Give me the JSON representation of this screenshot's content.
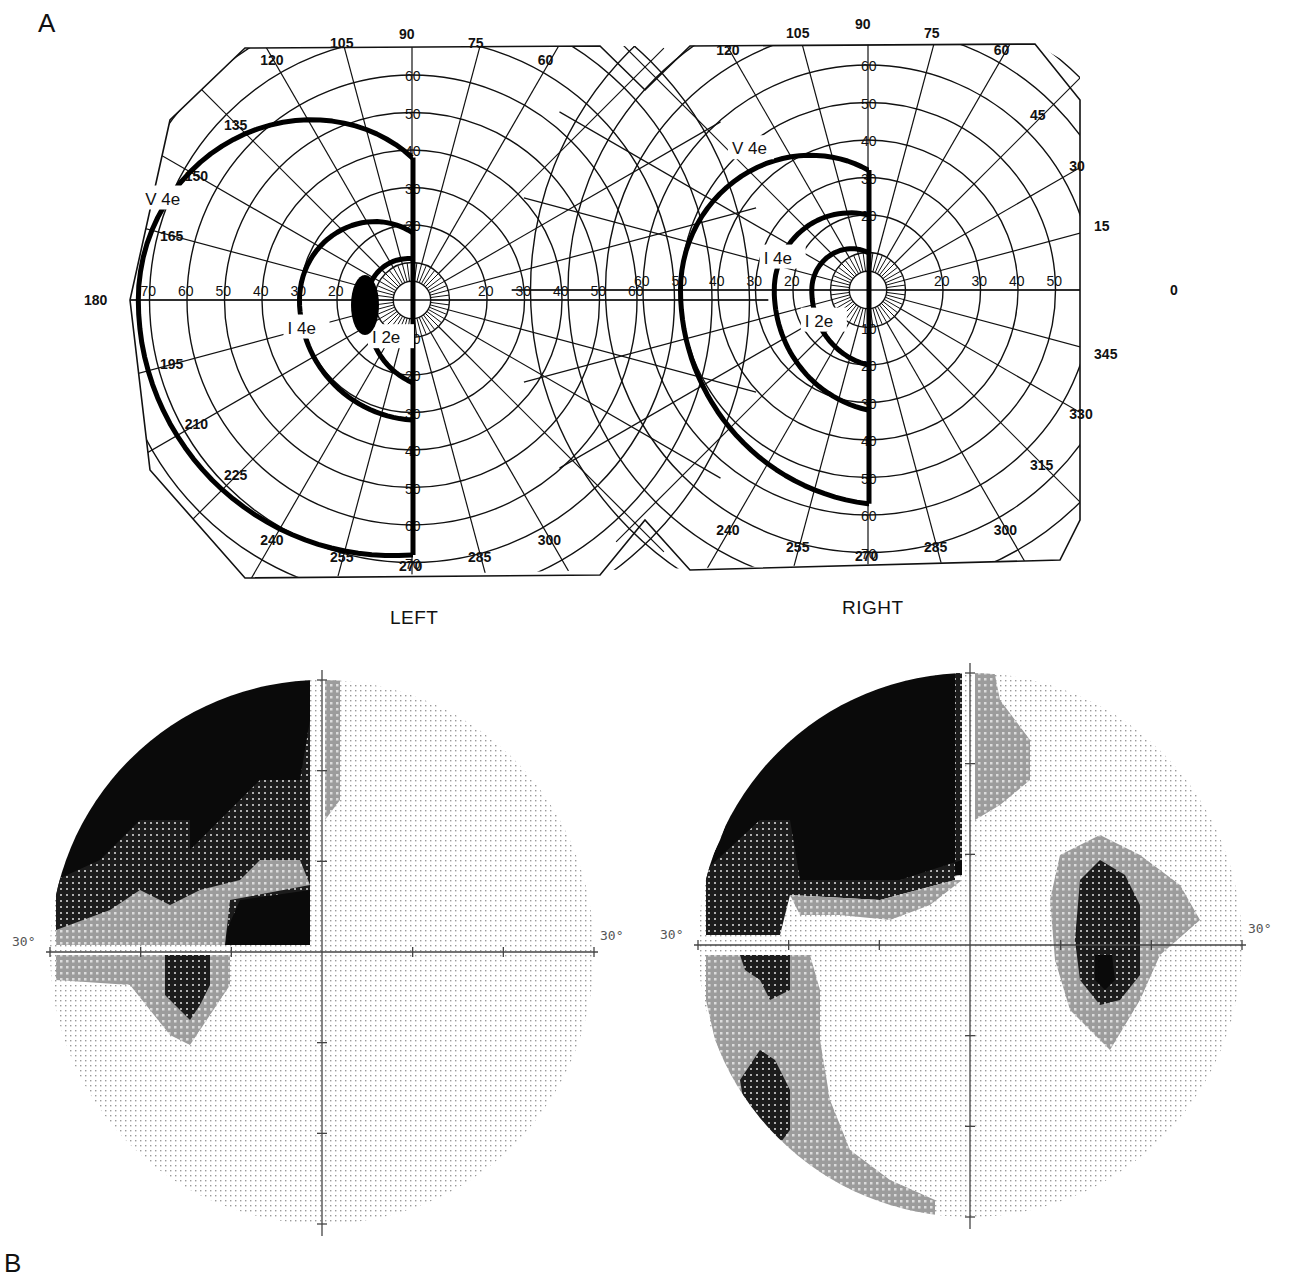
{
  "figure": {
    "panel_a_label": "A",
    "panel_b_label": "B"
  },
  "goldmann": {
    "left": {
      "eye_label": "LEFT",
      "center": [
        412,
        300
      ],
      "isopters": [
        {
          "name": "V 4e",
          "label": "V 4e"
        },
        {
          "name": "I 4e",
          "label": "I 4e"
        },
        {
          "name": "I 2e",
          "label": "I 2e"
        }
      ]
    },
    "right": {
      "eye_label": "RIGHT",
      "center": [
        868,
        290
      ],
      "isopters": [
        {
          "name": "V 4e",
          "label": "V 4e"
        },
        {
          "name": "I 4e",
          "label": "I 4e"
        },
        {
          "name": "I 2e",
          "label": "I 2e"
        }
      ]
    },
    "meridian_labels": [
      "0",
      "15",
      "30",
      "45",
      "60",
      "75",
      "90",
      "105",
      "120",
      "135",
      "150",
      "165",
      "180",
      "195",
      "210",
      "225",
      "240",
      "255",
      "270",
      "285",
      "300",
      "315",
      "330",
      "345"
    ],
    "eccentricity_labels": [
      "10",
      "20",
      "30",
      "40",
      "50",
      "60",
      "70",
      "80"
    ]
  },
  "hfa": {
    "left": {
      "axis_label_left": "30°",
      "axis_label_right": "30°",
      "center": [
        322,
        952
      ]
    },
    "right": {
      "axis_label_left": "30°",
      "axis_label_right": "30°",
      "center": [
        970,
        945
      ]
    }
  },
  "chart_data": {
    "type": "polar",
    "panels": [
      {
        "panel": "A",
        "eye": "LEFT",
        "chart": "Goldmann kinetic perimetry",
        "isopters": [
          {
            "target": "V 4e",
            "extent_deg_temporal": 75,
            "extent_deg_superior": 38,
            "extent_deg_inferior": 68,
            "respects_vertical_meridian": true,
            "side": "left hemifield only"
          },
          {
            "target": "I 4e",
            "extent_deg_temporal": 30,
            "extent_deg_superior": 18,
            "extent_deg_inferior": 32,
            "respects_vertical_meridian": true,
            "side": "left hemifield only"
          },
          {
            "target": "I 2e",
            "extent_deg_temporal": 12,
            "extent_deg_superior": 12,
            "extent_deg_inferior": 22,
            "respects_vertical_meridian": true,
            "side": "left hemifield only"
          }
        ],
        "blind_spot": {
          "meridian_deg": 180,
          "eccentricity_deg": 15
        }
      },
      {
        "panel": "A",
        "eye": "RIGHT",
        "chart": "Goldmann kinetic perimetry",
        "isopters": [
          {
            "target": "V 4e",
            "extent_deg_temporal": 50,
            "extent_deg_superior": 32,
            "extent_deg_inferior": 55,
            "respects_vertical_meridian": true,
            "side": "left hemifield only"
          },
          {
            "target": "I 4e",
            "extent_deg_temporal": 25,
            "extent_deg_superior": 20,
            "extent_deg_inferior": 32,
            "respects_vertical_meridian": true,
            "side": "left hemifield only"
          },
          {
            "target": "I 2e",
            "extent_deg_temporal": 16,
            "extent_deg_superior": 10,
            "extent_deg_inferior": 20,
            "respects_vertical_meridian": true,
            "side": "left hemifield only"
          }
        ]
      },
      {
        "panel": "B",
        "eye": "LEFT",
        "chart": "Static perimetry grayscale (30°)",
        "axis_range_deg": [
          -30,
          30
        ],
        "findings": "Dense superior-left quadrant defect with grayscale extending inferiorly near fixation-left; right hemifield normal"
      },
      {
        "panel": "B",
        "eye": "RIGHT",
        "chart": "Static perimetry grayscale (30°)",
        "axis_range_deg": [
          -30,
          30
        ],
        "findings": "Dense superior-left quadrant defect, inferior-left relative defect, physiologic blind spot in right hemifield at ~15°"
      }
    ],
    "legend": [
      "V 4e",
      "I 4e",
      "I 2e"
    ]
  }
}
